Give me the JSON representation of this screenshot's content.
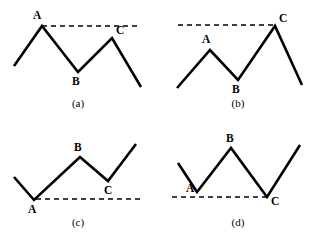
{
  "figure": {
    "width": 315,
    "height": 238,
    "background_color": "#ffffff",
    "stroke_color": "#000000",
    "panels": [
      {
        "id": "panel-a",
        "caption": "(a)",
        "caption_pos": {
          "x": 78,
          "y": 107
        },
        "polyline": "14,66 42,26 78,72 112,38 141,87",
        "guideline": "42,26 138,26",
        "points": [
          {
            "label": "A",
            "x": 42,
            "y": 26,
            "label_x": 33,
            "label_y": 19
          },
          {
            "label": "B",
            "x": 78,
            "y": 72,
            "label_x": 72,
            "label_y": 85
          },
          {
            "label": "C",
            "x": 112,
            "y": 38,
            "label_x": 116,
            "label_y": 34
          }
        ]
      },
      {
        "id": "panel-b",
        "caption": "(b)",
        "caption_pos": {
          "x": 238,
          "y": 107
        },
        "polyline": "177,88 210,50 238,80 275,26 302,85",
        "guideline": "178,25 273,25",
        "points": [
          {
            "label": "A",
            "x": 210,
            "y": 50,
            "label_x": 202,
            "label_y": 43
          },
          {
            "label": "B",
            "x": 238,
            "y": 80,
            "label_x": 232,
            "label_y": 93
          },
          {
            "label": "C",
            "x": 275,
            "y": 26,
            "label_x": 279,
            "label_y": 22
          }
        ]
      },
      {
        "id": "panel-c",
        "caption": "(c)",
        "caption_pos": {
          "x": 78,
          "y": 226
        },
        "polyline": "14,177 34,200 80,157 108,181 136,144",
        "guideline": "36,199 140,199",
        "points": [
          {
            "label": "A",
            "x": 34,
            "y": 200,
            "label_x": 28,
            "label_y": 213
          },
          {
            "label": "B",
            "x": 80,
            "y": 157,
            "label_x": 74,
            "label_y": 151
          },
          {
            "label": "C",
            "x": 108,
            "y": 181,
            "label_x": 104,
            "label_y": 194
          }
        ]
      },
      {
        "id": "panel-d",
        "caption": "(d)",
        "caption_pos": {
          "x": 238,
          "y": 226
        },
        "polyline": "178,163 197,192 231,148 267,197 300,145",
        "guideline": "172,197 266,197",
        "points": [
          {
            "label": "A",
            "x": 197,
            "y": 192,
            "label_x": 186,
            "label_y": 192
          },
          {
            "label": "B",
            "x": 231,
            "y": 148,
            "label_x": 226,
            "label_y": 142
          },
          {
            "label": "C",
            "x": 267,
            "y": 197,
            "label_x": 271,
            "label_y": 205
          }
        ]
      }
    ]
  },
  "chart_data": {
    "type": "line",
    "title": "",
    "xlabel": "",
    "ylabel": "",
    "grid": false,
    "legend": null,
    "charts": [
      {
        "name": "(a)",
        "x": [
          14,
          42,
          78,
          112,
          141
        ],
        "y": [
          66,
          26,
          72,
          38,
          87
        ],
        "annotations": [
          {
            "label": "A",
            "x": 42,
            "y": 26
          },
          {
            "label": "B",
            "x": 78,
            "y": 72
          },
          {
            "label": "C",
            "x": 112,
            "y": 38
          }
        ],
        "reference_line": {
          "from_x": 42,
          "to_x": 138,
          "y": 26,
          "anchor": "A",
          "style": "dashed"
        },
        "note": "C peak lower than A peak"
      },
      {
        "name": "(b)",
        "x": [
          177,
          210,
          238,
          275,
          302
        ],
        "y": [
          88,
          50,
          80,
          26,
          85
        ],
        "annotations": [
          {
            "label": "A",
            "x": 210,
            "y": 50
          },
          {
            "label": "B",
            "x": 238,
            "y": 80
          },
          {
            "label": "C",
            "x": 275,
            "y": 26
          }
        ],
        "reference_line": {
          "from_x": 178,
          "to_x": 273,
          "y": 25,
          "anchor": "C",
          "style": "dashed"
        },
        "note": "C peak higher than A peak"
      },
      {
        "name": "(c)",
        "x": [
          14,
          34,
          80,
          108,
          136
        ],
        "y": [
          177,
          200,
          157,
          181,
          144
        ],
        "annotations": [
          {
            "label": "A",
            "x": 34,
            "y": 200
          },
          {
            "label": "B",
            "x": 80,
            "y": 157
          },
          {
            "label": "C",
            "x": 108,
            "y": 181
          }
        ],
        "reference_line": {
          "from_x": 36,
          "to_x": 140,
          "y": 199,
          "anchor": "A",
          "style": "dashed"
        },
        "note": "C trough higher than A trough"
      },
      {
        "name": "(d)",
        "x": [
          178,
          197,
          231,
          267,
          300
        ],
        "y": [
          163,
          192,
          148,
          197,
          145
        ],
        "annotations": [
          {
            "label": "A",
            "x": 197,
            "y": 192
          },
          {
            "label": "B",
            "x": 231,
            "y": 148
          },
          {
            "label": "C",
            "x": 267,
            "y": 197
          }
        ],
        "reference_line": {
          "from_x": 172,
          "to_x": 266,
          "y": 197,
          "anchor": "C",
          "style": "dashed"
        },
        "note": "C trough lower than A trough"
      }
    ]
  }
}
